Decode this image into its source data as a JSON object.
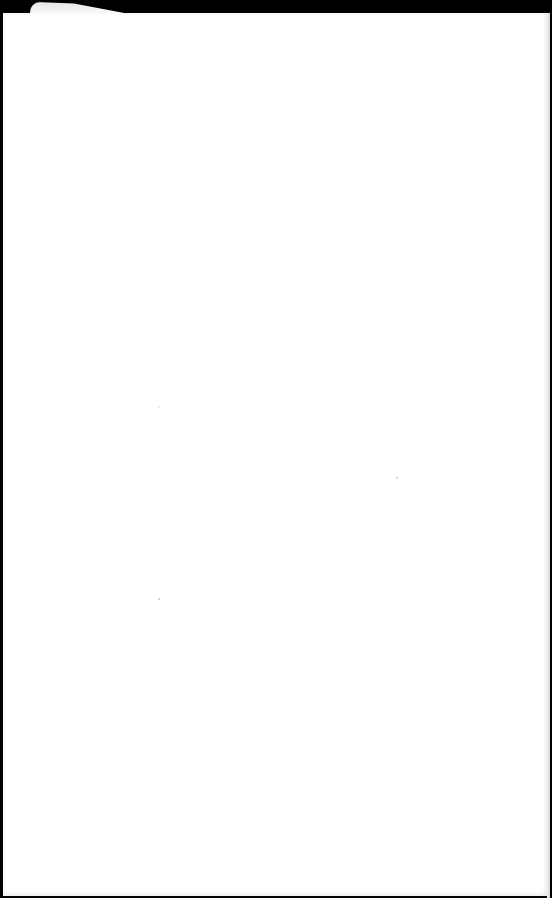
{
  "scene": {
    "description": "Photo of a blank white sheet of paper on a black background",
    "background_color": "#000000",
    "paper_color": "#ffffff",
    "text": []
  }
}
